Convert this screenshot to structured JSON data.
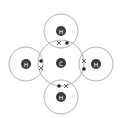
{
  "diagram": {
    "title": "",
    "central_atom": {
      "label": "C",
      "cx": 61,
      "cy": 63,
      "r": 23
    },
    "outer_atoms": [
      {
        "label": "H",
        "position": "top",
        "cx": 61,
        "cy": 31,
        "r": 17
      },
      {
        "label": "H",
        "position": "left",
        "cx": 26,
        "cy": 64,
        "r": 17
      },
      {
        "label": "H",
        "position": "right",
        "cx": 96,
        "cy": 64,
        "r": 17
      },
      {
        "label": "H",
        "position": "bottom",
        "cx": 61,
        "cy": 97,
        "r": 17
      }
    ],
    "bonds": [
      {
        "position": "top",
        "symbols": [
          "cross",
          "dot"
        ]
      },
      {
        "position": "left",
        "symbols": [
          "dot",
          "cross"
        ]
      },
      {
        "position": "right",
        "symbols": [
          "cross",
          "dot"
        ]
      },
      {
        "position": "bottom",
        "symbols": [
          "dot",
          "cross"
        ]
      }
    ],
    "colors": {
      "shell": "#9a9a9a",
      "nucleus": "#3a3a3a",
      "electron": "#222222"
    }
  }
}
